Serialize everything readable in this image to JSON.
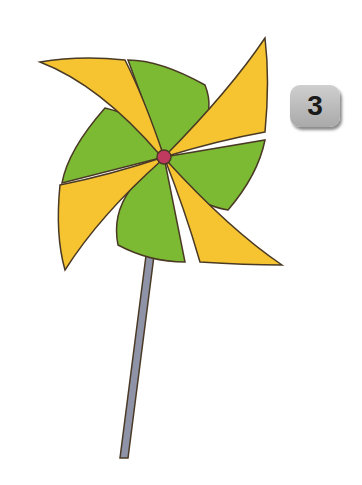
{
  "badge": {
    "number": "3"
  },
  "illustration": {
    "subject": "pinwheel",
    "colors": {
      "yellow": "#f6c431",
      "yellow_light": "#fbdc5c",
      "green": "#7cba33",
      "green_light": "#a2d14a",
      "hub": "#c03a5f",
      "stick": "#8e93a8",
      "outline": "#4a3a25"
    }
  }
}
